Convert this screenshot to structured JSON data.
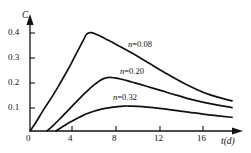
{
  "chart_data": {
    "type": "line",
    "title": "",
    "xlabel": "t(d)",
    "ylabel": "C",
    "xlim": [
      0,
      20.5
    ],
    "ylim": [
      0,
      0.45
    ],
    "grid": false,
    "legend_position": "inline-annotations",
    "xticks": [
      0,
      4,
      8,
      12,
      16
    ],
    "xtick_labels": [
      "0",
      "4",
      "8",
      "12",
      "16"
    ],
    "yticks": [
      0.1,
      0.2,
      0.3,
      0.4
    ],
    "ytick_labels": [
      "0.1",
      "0.2",
      "0.3",
      "0.4"
    ],
    "series": [
      {
        "name": "n = 0.08",
        "label_n": "n",
        "label_eq": "=",
        "label_value": "0.08",
        "x": [
          0,
          0.6,
          1.4,
          2.3,
          3.2,
          4.1,
          4.9,
          5.4,
          5.7,
          6.1,
          6.7,
          7.6,
          8.8,
          10.2,
          11.8,
          13.4,
          15.0,
          16.6,
          18.2,
          20.3
        ],
        "y": [
          0,
          0.035,
          0.088,
          0.143,
          0.204,
          0.268,
          0.33,
          0.368,
          0.389,
          0.395,
          0.388,
          0.37,
          0.345,
          0.314,
          0.276,
          0.238,
          0.202,
          0.17,
          0.144,
          0.121
        ]
      },
      {
        "name": "n = 0.20",
        "label_n": "n",
        "label_eq": "=",
        "label_value": "0.20",
        "x": [
          1.7,
          2.4,
          3.2,
          4.0,
          4.8,
          5.6,
          6.4,
          7.0,
          7.5,
          7.9,
          8.4,
          9.2,
          10.3,
          11.7,
          13.2,
          14.8,
          16.4,
          18.1,
          20.3
        ],
        "y": [
          0,
          0.025,
          0.057,
          0.09,
          0.123,
          0.155,
          0.184,
          0.202,
          0.212,
          0.215,
          0.214,
          0.208,
          0.196,
          0.18,
          0.162,
          0.143,
          0.125,
          0.11,
          0.094
        ]
      },
      {
        "name": "n = 0.32",
        "label_n": "n",
        "label_eq": "=",
        "label_value": "0.32",
        "x": [
          2.6,
          3.3,
          4.1,
          5.0,
          5.9,
          6.8,
          7.7,
          8.6,
          9.4,
          10.1,
          10.8,
          11.8,
          13.0,
          14.4,
          15.9,
          17.4,
          18.9,
          20.3
        ],
        "y": [
          0,
          0.018,
          0.037,
          0.056,
          0.072,
          0.084,
          0.092,
          0.097,
          0.1,
          0.1,
          0.099,
          0.096,
          0.091,
          0.084,
          0.076,
          0.068,
          0.061,
          0.055
        ]
      }
    ],
    "colors": {
      "axis": "#111111",
      "curve": "#111111",
      "background": "#ffffff"
    }
  }
}
